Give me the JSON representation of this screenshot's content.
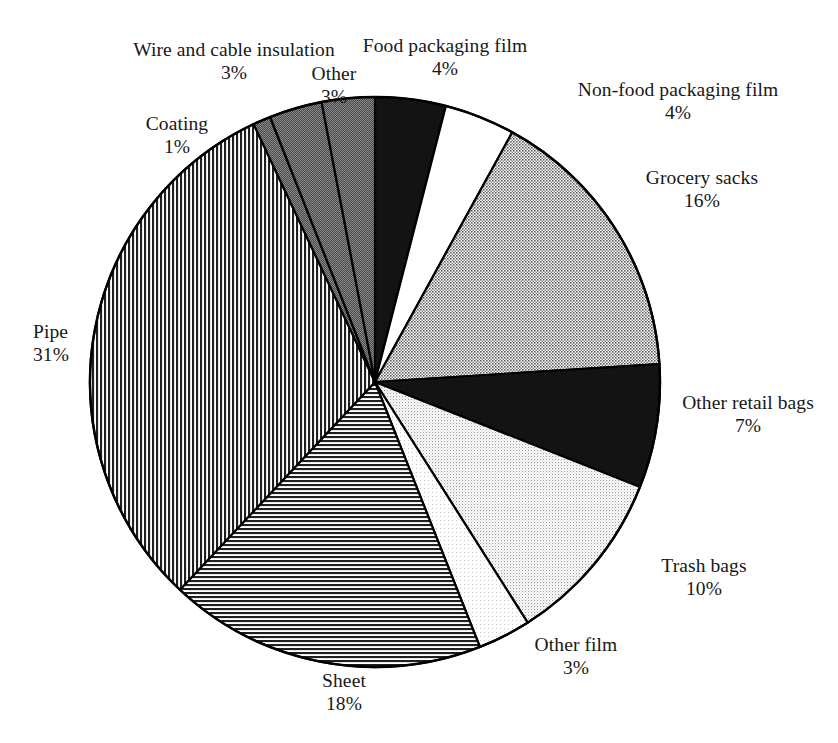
{
  "chart_data": {
    "type": "pie",
    "title": "",
    "subtitle": "",
    "xlabel": "",
    "ylabel": "",
    "legend_position": "none",
    "grid": false,
    "units": "percent",
    "start_angle_deg": 0,
    "direction": "clockwise",
    "categories": [
      "Food packaging film",
      "Non-food packaging film",
      "Grocery sacks",
      "Other retail bags",
      "Trash bags",
      "Other film",
      "Sheet",
      "Pipe",
      "Coating",
      "Wire and cable insulation",
      "Other"
    ],
    "values": [
      4,
      4,
      16,
      7,
      10,
      3,
      18,
      31,
      1,
      3,
      3
    ],
    "value_labels": [
      "4%",
      "4%",
      "16%",
      "7%",
      "10%",
      "3%",
      "18%",
      "31%",
      "1%",
      "3%",
      "3%"
    ],
    "slices": [
      {
        "label": "Food packaging film",
        "value": 4,
        "value_label": "4%",
        "fill": "solid-black",
        "color": "#111111"
      },
      {
        "label": "Non-food packaging film",
        "value": 4,
        "value_label": "4%",
        "fill": "solid-white",
        "color": "#ffffff"
      },
      {
        "label": "Grocery sacks",
        "value": 16,
        "value_label": "16%",
        "fill": "gray-medium",
        "color": "#9a9a9a"
      },
      {
        "label": "Other retail bags",
        "value": 7,
        "value_label": "7%",
        "fill": "solid-black",
        "color": "#131313"
      },
      {
        "label": "Trash bags",
        "value": 10,
        "value_label": "10%",
        "fill": "gray-light",
        "color": "#cfcfcf"
      },
      {
        "label": "Other film",
        "value": 3,
        "value_label": "3%",
        "fill": "gray-pale",
        "color": "#f0f0f0"
      },
      {
        "label": "Sheet",
        "value": 18,
        "value_label": "18%",
        "fill": "hatch-horizontal",
        "color": "#6e6e6e"
      },
      {
        "label": "Pipe",
        "value": 31,
        "value_label": "31%",
        "fill": "hatch-vertical",
        "color": "#6e6e6e"
      },
      {
        "label": "Coating",
        "value": 1,
        "value_label": "1%",
        "fill": "gray-dark",
        "color": "#737373"
      },
      {
        "label": "Wire and cable insulation",
        "value": 3,
        "value_label": "3%",
        "fill": "gray-dark",
        "color": "#6b6b6b"
      },
      {
        "label": "Other",
        "value": 3,
        "value_label": "3%",
        "fill": "gray-dark",
        "color": "#6b6b6b"
      }
    ]
  },
  "labels": {
    "food_packaging_film": {
      "name": "Food packaging film",
      "value": "4%"
    },
    "non_food_packaging_film": {
      "name": "Non-food packaging film",
      "value": "4%"
    },
    "grocery_sacks": {
      "name": "Grocery sacks",
      "value": "16%"
    },
    "other_retail_bags": {
      "name": "Other retail bags",
      "value": "7%"
    },
    "trash_bags": {
      "name": "Trash bags",
      "value": "10%"
    },
    "other_film": {
      "name": "Other film",
      "value": "3%"
    },
    "sheet": {
      "name": "Sheet",
      "value": "18%"
    },
    "pipe": {
      "name": "Pipe",
      "value": "31%"
    },
    "coating": {
      "name": "Coating",
      "value": "1%"
    },
    "wire_and_cable": {
      "name": "Wire and cable insulation",
      "value": "3%"
    },
    "other": {
      "name": "Other",
      "value": "3%"
    }
  },
  "colors": {
    "outline": "#000000",
    "background": "#ffffff",
    "text": "#171717"
  }
}
